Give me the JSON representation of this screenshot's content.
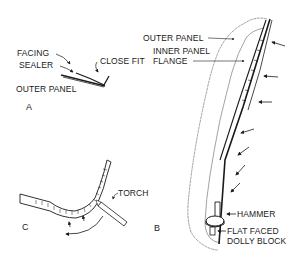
{
  "figures": {
    "A": {
      "label": "A",
      "callouts": {
        "facing": "FACING",
        "sealer": "SEALER",
        "close_fit": "CLOSE FIT",
        "outer_panel": "OUTER PANEL"
      }
    },
    "B": {
      "label": "B",
      "callouts": {
        "outer_panel": "OUTER PANEL",
        "inner_panel_line1": "INNER PANEL",
        "inner_panel_line2": "FLANGE",
        "hammer": "HAMMER",
        "dolly_line1": "FLAT FACED",
        "dolly_line2": "DOLLY BLOCK"
      }
    },
    "C": {
      "label": "C",
      "callouts": {
        "torch": "TORCH"
      }
    }
  },
  "colors": {
    "ink": "#1a1a1a",
    "light_ink": "#8a8a8a",
    "background": "#ffffff"
  }
}
